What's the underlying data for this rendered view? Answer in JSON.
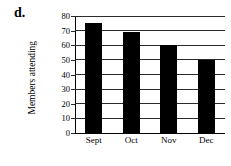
{
  "part_label": "d.",
  "chart_data": {
    "type": "bar",
    "title": "",
    "xlabel": "",
    "ylabel": "Members attending",
    "categories": [
      "Sept",
      "Oct",
      "Nov",
      "Dec"
    ],
    "values": [
      75,
      69,
      60,
      50
    ],
    "ylim": [
      0,
      80
    ],
    "ytick_labels": [
      "0",
      "10",
      "20",
      "30",
      "40",
      "50",
      "60",
      "70",
      "80"
    ],
    "ytick_values": [
      0,
      10,
      20,
      30,
      40,
      50,
      60,
      70,
      80
    ],
    "grid": "horizontal",
    "legend": "none",
    "bar_color": "#000000",
    "axis_color": "#000000",
    "grid_color": "#2b2b2b",
    "background_color": "#ffffff"
  }
}
